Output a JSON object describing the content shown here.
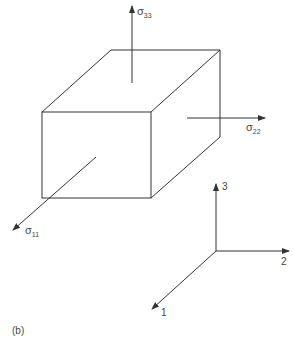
{
  "figure": {
    "label": "(b)",
    "element": "stress cube",
    "stresses": [
      {
        "symbol": "σ",
        "sub": "33",
        "direction": "3"
      },
      {
        "symbol": "σ",
        "sub": "22",
        "direction": "2"
      },
      {
        "symbol": "σ",
        "sub": "11",
        "direction": "1"
      }
    ],
    "axes": [
      {
        "label": "3"
      },
      {
        "label": "2"
      },
      {
        "label": "1"
      }
    ]
  },
  "colors": {
    "line": "#333333",
    "background": "#ffffff"
  }
}
